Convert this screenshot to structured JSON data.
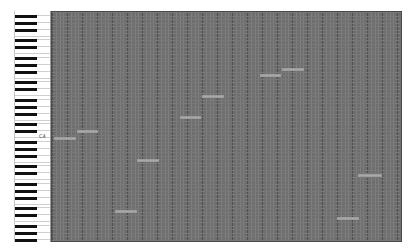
{
  "app": {
    "view": "piano-roll"
  },
  "keyboard": {
    "label_c4": "C4",
    "top_px": 11,
    "semitone_px": 3.5,
    "black_key_offsets_px": [
      2,
      9,
      16,
      23,
      30,
      37,
      44,
      51,
      58,
      65,
      72,
      79,
      86,
      93,
      100,
      107,
      114,
      121,
      128,
      135,
      142,
      149,
      156,
      163,
      170,
      177,
      184,
      191,
      198,
      205,
      212,
      219,
      226
    ]
  },
  "grid": {
    "background": "#6e6e6e",
    "fine_line_color": "#7f7f7f",
    "beat_line_color": "#4f4f4f",
    "row_line_color": "#787878",
    "fine_step_px": 3.75,
    "beat_every": 4,
    "row_step_px": 3.5
  },
  "notes": [
    {
      "x": 53,
      "y": 136,
      "w": 22,
      "pitch": "C4"
    },
    {
      "x": 76,
      "y": 129,
      "w": 21,
      "pitch": "E4"
    },
    {
      "x": 114,
      "y": 209,
      "w": 22,
      "pitch": ""
    },
    {
      "x": 136,
      "y": 158,
      "w": 22,
      "pitch": ""
    },
    {
      "x": 179,
      "y": 115,
      "w": 21,
      "pitch": ""
    },
    {
      "x": 201,
      "y": 94,
      "w": 22,
      "pitch": ""
    },
    {
      "x": 259,
      "y": 73,
      "w": 21,
      "pitch": ""
    },
    {
      "x": 281,
      "y": 67,
      "w": 22,
      "pitch": ""
    },
    {
      "x": 336,
      "y": 216,
      "w": 22,
      "pitch": ""
    },
    {
      "x": 357,
      "y": 173,
      "w": 24,
      "pitch": ""
    }
  ],
  "colors": {
    "note_fill": "#a9a9a9",
    "black_key": "#111111",
    "white_key": "#ffffff"
  }
}
